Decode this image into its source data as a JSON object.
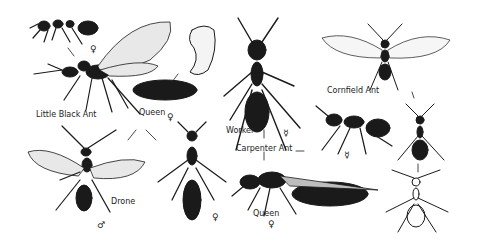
{
  "plate": {
    "title": "Ants illustration plate",
    "ink_color": "#1a1a1a",
    "background": "#ffffff"
  },
  "labels": {
    "little_black_ant": "Little Black Ant",
    "queen_left": "Queen",
    "queen_left_symbol": "♀",
    "winged_queen_symbol": "♀",
    "drone": "Drone",
    "drone_symbol": "♂",
    "dealate_queen_symbol": "♀",
    "worker": "Worker",
    "worker_symbol": "☿",
    "carpenter_ant": "Carpenter Ant",
    "carpenter_queen": "Queen",
    "carpenter_queen_symbol": "♀",
    "carpenter_side_worker_symbol": "☿",
    "cornfield_ant": "Cornfield Ant"
  }
}
